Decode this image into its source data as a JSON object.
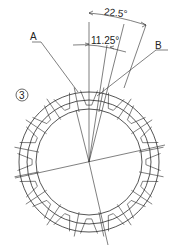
{
  "figure": {
    "view_number": "3",
    "labels": {
      "a": "A",
      "b": "B"
    },
    "dimensions": {
      "outer_angle": "22.5°",
      "inner_angle": "11.25°"
    },
    "gear": {
      "center": [
        89,
        162
      ],
      "outer_radius": 70,
      "root_radius": 62,
      "bore_radius": 53,
      "teeth": 16
    },
    "line_color": "#2a2a2a"
  }
}
